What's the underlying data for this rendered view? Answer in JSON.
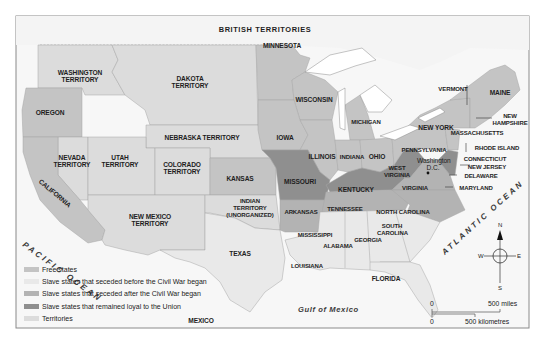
{
  "map": {
    "title": "United States at the Outbreak of the Civil War",
    "top_label": "BRITISH TERRITORIES",
    "colors": {
      "free": "#c4c4c4",
      "seceded_before": "#e9e9e9",
      "seceded_after": "#b3b3b3",
      "loyal_slave": "#8f8f8f",
      "territory": "#dcdcdc",
      "water": "#f2f2f2",
      "foreign": "#f7f7f7",
      "border": "#9a9a9a"
    },
    "regions": {
      "washington_territory": "WASHINGTON TERRITORY",
      "dakota_territory": "DAKOTA TERRITORY",
      "oregon": "OREGON",
      "nebraska_territory": "NEBRASKA TERRITORY",
      "nevada_territory": "NEVADA TERRITORY",
      "utah_territory": "UTAH TERRITORY",
      "colorado_territory": "COLORADO TERRITORY",
      "kansas": "KANSAS",
      "california": "CALIFORNIA",
      "new_mexico_territory": "NEW MEXICO TERRITORY",
      "indian_territory": "INDIAN TERRITORY (UNORGANIZED)",
      "texas": "TEXAS",
      "minnesota": "MINNESOTA",
      "wisconsin": "WISCONSIN",
      "iowa": "IOWA",
      "michigan": "MICHIGAN",
      "illinois": "ILLINOIS",
      "indiana": "INDIANA",
      "ohio": "OHIO",
      "missouri": "MISSOURI",
      "kentucky": "KENTUCKY",
      "west_virginia": "WEST VIRGINIA",
      "virginia": "VIRGINIA",
      "pennsylvania": "PENNSYLVANIA",
      "new_york": "NEW YORK",
      "vermont": "VERMONT",
      "maine": "MAINE",
      "new_hampshire": "NEW HAMPSHIRE",
      "massachusetts": "MASSACHUSETTS",
      "rhode_island": "RHODE ISLAND",
      "connecticut": "CONNECTICUT",
      "new_jersey": "NEW JERSEY",
      "delaware": "DELAWARE",
      "maryland": "MARYLAND",
      "washington_dc": "Washington D.C.",
      "arkansas": "ARKANSAS",
      "tennessee": "TENNESSEE",
      "north_carolina": "NORTH CAROLINA",
      "south_carolina": "SOUTH CAROLINA",
      "mississippi": "MISSISSIPPI",
      "alabama": "ALABAMA",
      "georgia": "GEORGIA",
      "louisiana": "LOUISIANA",
      "florida": "FLORIDA",
      "mexico": "MEXICO"
    },
    "water": {
      "pacific": "PACIFIC OCEAN",
      "atlantic": "ATLANTIC OCEAN",
      "gulf": "Gulf of Mexico"
    },
    "compass": {
      "n": "N",
      "s": "S",
      "e": "E",
      "w": "W"
    },
    "scale": {
      "zero_top": "0",
      "miles": "500 miles",
      "zero_bottom": "0",
      "km": "500 kilometres"
    }
  },
  "legend": {
    "items": [
      {
        "label": "Free states",
        "color": "#c4c4c4"
      },
      {
        "label": "Slave states that seceded before the Civil War began",
        "color": "#e9e9e9"
      },
      {
        "label": "Slave states that seceded after the Civil War began",
        "color": "#b3b3b3"
      },
      {
        "label": "Slave states that remained loyal to the Union",
        "color": "#8f8f8f"
      },
      {
        "label": "Territories",
        "color": "#dcdcdc"
      }
    ]
  }
}
